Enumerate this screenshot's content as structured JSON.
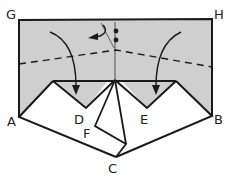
{
  "diagram": {
    "type": "origami-fold-step",
    "colors": {
      "shaded": "#cfcfcf",
      "paper": "#ffffff",
      "line": "#1a1a1a"
    },
    "labels": {
      "G": "G",
      "H": "H",
      "A": "A",
      "B": "B",
      "C": "C",
      "D": "D",
      "E": "E",
      "F": "F"
    },
    "symbols": {
      "fold_arrows": [
        "left-curved-arrow-to-D",
        "right-curved-arrow-to-E"
      ],
      "small_turn_arrow": "turn-over-arrow",
      "dots": 2,
      "fold_line": "dashed-valley-fold"
    }
  }
}
